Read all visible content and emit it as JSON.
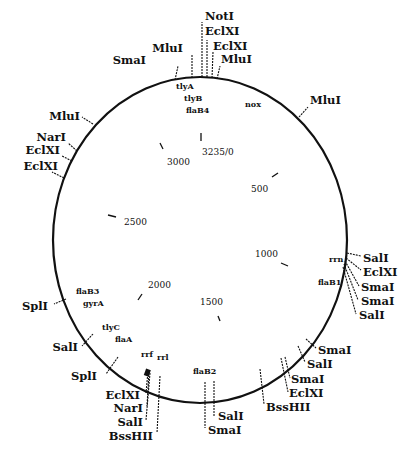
{
  "diagram": {
    "type": "circular restriction map",
    "total_length_label": "3235/0",
    "coordinate_ticks": [
      {
        "label": "3235/0",
        "x": 202,
        "y": 155,
        "tick": [
          201,
          133,
          201,
          141
        ]
      },
      {
        "label": "500",
        "x": 251,
        "y": 192,
        "tick": [
          272,
          177,
          278,
          173
        ]
      },
      {
        "label": "1000",
        "x": 255,
        "y": 257,
        "tick": [
          281,
          263,
          288,
          266
        ]
      },
      {
        "label": "1500",
        "x": 200,
        "y": 305,
        "tick": [
          218,
          316,
          220,
          321
        ]
      },
      {
        "label": "2000",
        "x": 148,
        "y": 288,
        "tick": [
          138,
          300,
          142,
          294
        ]
      },
      {
        "label": "2500",
        "x": 124,
        "y": 225,
        "tick": [
          108,
          215,
          116,
          217
        ]
      },
      {
        "label": "3000",
        "x": 167,
        "y": 165,
        "tick": [
          160,
          143,
          163,
          149
        ]
      }
    ],
    "restriction_sites": [
      {
        "label": "SmaI",
        "x": 146,
        "y": 64,
        "anchor": "end",
        "line": [
          175,
          80,
          178,
          66
        ]
      },
      {
        "label": "MluI",
        "x": 183,
        "y": 52,
        "anchor": "end",
        "line": [
          192,
          78,
          192,
          55
        ]
      },
      {
        "label": "NotI",
        "x": 205,
        "y": 20,
        "anchor": "start",
        "line": [
          202,
          77,
          202,
          22
        ]
      },
      {
        "label": "EclXI",
        "x": 205,
        "y": 35,
        "anchor": "start",
        "line": [
          207,
          77,
          207,
          40
        ]
      },
      {
        "label": "EclXI",
        "x": 213,
        "y": 50,
        "anchor": "start",
        "line": [
          212,
          78,
          213,
          52
        ]
      },
      {
        "label": "MluI",
        "x": 221,
        "y": 63,
        "anchor": "start",
        "line": [
          217,
          79,
          220,
          66
        ]
      },
      {
        "label": "MluI",
        "x": 310,
        "y": 104,
        "anchor": "start",
        "line": [
          299,
          117,
          308,
          107
        ]
      },
      {
        "label": "MluI",
        "x": 80,
        "y": 120,
        "anchor": "end",
        "line": [
          93,
          124,
          82,
          117
        ]
      },
      {
        "label": "NarI",
        "x": 66,
        "y": 141,
        "anchor": "end",
        "line": [
          77,
          151,
          68,
          143
        ]
      },
      {
        "label": "EclXI",
        "x": 60,
        "y": 154,
        "anchor": "end",
        "line": [
          72,
          161,
          62,
          156
        ]
      },
      {
        "label": "EclXI",
        "x": 58,
        "y": 170,
        "anchor": "end",
        "line": [
          64,
          178,
          52,
          172
        ]
      },
      {
        "label": "SalI",
        "x": 363,
        "y": 262,
        "anchor": "start",
        "line": [
          347,
          253,
          361,
          256
        ]
      },
      {
        "label": "EclXI",
        "x": 363,
        "y": 276,
        "anchor": "start",
        "line": [
          346,
          258,
          361,
          270
        ]
      },
      {
        "label": "SmaI",
        "x": 361,
        "y": 291,
        "anchor": "start",
        "line": [
          345,
          261,
          359,
          286
        ]
      },
      {
        "label": "SmaI",
        "x": 361,
        "y": 305,
        "anchor": "start",
        "line": [
          344,
          264,
          358,
          300
        ]
      },
      {
        "label": "SalI",
        "x": 359,
        "y": 319,
        "anchor": "start",
        "line": [
          343,
          267,
          356,
          314
        ]
      },
      {
        "label": "SmaI",
        "x": 318,
        "y": 354,
        "anchor": "start",
        "line": [
          306,
          339,
          316,
          348
        ]
      },
      {
        "label": "SalI",
        "x": 307,
        "y": 368,
        "anchor": "start",
        "line": [
          298,
          346,
          305,
          362
        ]
      },
      {
        "label": "SmaI",
        "x": 291,
        "y": 383,
        "anchor": "start",
        "line": [
          285,
          357,
          290,
          378
        ]
      },
      {
        "label": "EclXI",
        "x": 289,
        "y": 397,
        "anchor": "start",
        "line": [
          281,
          358,
          288,
          392
        ]
      },
      {
        "label": "BssHII",
        "x": 266,
        "y": 411,
        "anchor": "start",
        "line": [
          260,
          369,
          264,
          404
        ]
      },
      {
        "label": "SalI",
        "x": 218,
        "y": 420,
        "anchor": "start",
        "line": [
          214,
          381,
          214,
          416
        ]
      },
      {
        "label": "SmaI",
        "x": 208,
        "y": 434,
        "anchor": "start",
        "line": [
          205,
          382,
          205,
          428
        ]
      },
      {
        "label": "SplI",
        "x": 48,
        "y": 310,
        "anchor": "end",
        "line": [
          66,
          299,
          54,
          304
        ]
      },
      {
        "label": "SalI",
        "x": 78,
        "y": 351,
        "anchor": "end",
        "line": [
          93,
          334,
          82,
          346
        ]
      },
      {
        "label": "SplI",
        "x": 97,
        "y": 380,
        "anchor": "end",
        "line": [
          118,
          357,
          106,
          374
        ]
      },
      {
        "label": "EclXI",
        "x": 140,
        "y": 399,
        "anchor": "end",
        "line": [
          148,
          371,
          146,
          393
        ]
      },
      {
        "label": "NarI",
        "x": 143,
        "y": 412,
        "anchor": "end",
        "line": [
          149,
          372,
          147,
          406
        ]
      },
      {
        "label": "SalI",
        "x": 143,
        "y": 426,
        "anchor": "end",
        "line": [
          150,
          373,
          146,
          420
        ]
      },
      {
        "label": "BssHII",
        "x": 153,
        "y": 440,
        "anchor": "end",
        "line": [
          160,
          376,
          157,
          433
        ]
      }
    ],
    "genes": [
      {
        "label": "tlyA",
        "x": 176,
        "y": 89
      },
      {
        "label": "tlyB",
        "x": 184,
        "y": 101
      },
      {
        "label": "flaB4",
        "x": 186,
        "y": 113
      },
      {
        "label": "nox",
        "x": 245,
        "y": 107
      },
      {
        "label": "rrn",
        "x": 329,
        "y": 262
      },
      {
        "label": "flaB1",
        "x": 318,
        "y": 285
      },
      {
        "label": "flaB2",
        "x": 193,
        "y": 374
      },
      {
        "label": "flaB3",
        "x": 76,
        "y": 294
      },
      {
        "label": "gyrA",
        "x": 83,
        "y": 306
      },
      {
        "label": "tlyC",
        "x": 102,
        "y": 330
      },
      {
        "label": "flaA",
        "x": 115,
        "y": 342
      },
      {
        "label": "rrf",
        "x": 141,
        "y": 357
      },
      {
        "label": "rrl",
        "x": 157,
        "y": 360
      }
    ]
  }
}
